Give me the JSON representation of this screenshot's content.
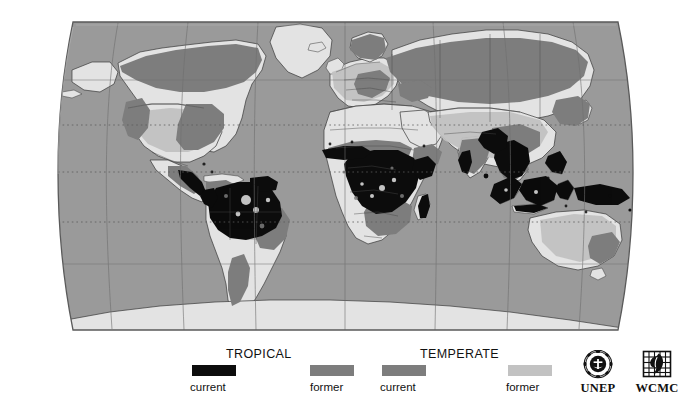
{
  "map": {
    "title": "World forest cover map",
    "projection": "Robinson",
    "ocean_color": "#9a9a9a",
    "land_color": "#e3e3e3",
    "graticule_color": "#6f6f6f",
    "coastline_color": "#3a3a3a",
    "border_color": "#4a4a4a",
    "frame_color": "#5a5a5a",
    "background_color": "#ffffff",
    "categories": {
      "tropical_current": "#0d0d0d",
      "tropical_former": "#7d7d7d",
      "temperate_current": "#7d7d7d",
      "temperate_former": "#c2c2c2"
    },
    "graticule": {
      "latitudes": [
        60,
        30,
        0,
        -30,
        -60
      ],
      "longitudes": [
        -150,
        -120,
        -90,
        -60,
        -30,
        0,
        30,
        60,
        90,
        120,
        150
      ],
      "dotted_latitudes": [
        30,
        0,
        -30
      ]
    }
  },
  "legend": {
    "groups": [
      {
        "title": "TROPICAL",
        "items": [
          {
            "label": "current",
            "color": "#0d0d0d",
            "swatch_name": "swatch-tropical-current"
          },
          {
            "label": "former",
            "color": "#7d7d7d",
            "swatch_name": "swatch-tropical-former"
          }
        ]
      },
      {
        "title": "TEMPERATE",
        "items": [
          {
            "label": "current",
            "color": "#7d7d7d",
            "swatch_name": "swatch-temperate-current"
          },
          {
            "label": "former",
            "color": "#c2c2c2",
            "swatch_name": "swatch-temperate-former"
          }
        ]
      }
    ]
  },
  "logos": [
    {
      "name": "unep-logo",
      "text": "UNEP",
      "mark": "laurel-wreath-globe-icon"
    },
    {
      "name": "wcmc-logo",
      "text": "WCMC",
      "mark": "leaf-grid-icon"
    }
  ]
}
